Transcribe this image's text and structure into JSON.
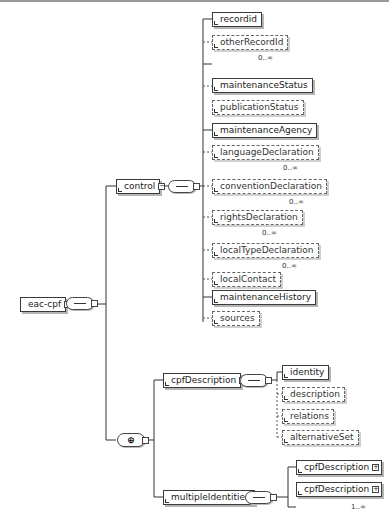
{
  "diagram": {
    "root": {
      "label": "eac-cpf",
      "toggle": "−"
    },
    "control": {
      "label": "control",
      "toggle": "−",
      "children": [
        {
          "label": "recordid",
          "optional": false,
          "cardinality": ""
        },
        {
          "label": "otherRecordId",
          "optional": true,
          "cardinality": "0..∞"
        },
        {
          "label": "maintenanceStatus",
          "optional": false,
          "cardinality": ""
        },
        {
          "label": "publicationStatus",
          "optional": true,
          "cardinality": ""
        },
        {
          "label": "maintenanceAgency",
          "optional": false,
          "cardinality": ""
        },
        {
          "label": "languageDeclaration",
          "optional": true,
          "cardinality": "0..∞"
        },
        {
          "label": "conventionDeclaration",
          "optional": true,
          "cardinality": "0..∞"
        },
        {
          "label": "rightsDeclaration",
          "optional": true,
          "cardinality": "0..∞"
        },
        {
          "label": "localTypeDeclaration",
          "optional": true,
          "cardinality": "0..∞"
        },
        {
          "label": "localContact",
          "optional": true,
          "cardinality": "0..∞"
        },
        {
          "label": "maintenanceHistory",
          "optional": false,
          "cardinality": ""
        },
        {
          "label": "sources",
          "optional": true,
          "cardinality": ""
        }
      ]
    },
    "choice": {
      "symbol": "⊕"
    },
    "cpfDescription": {
      "label": "cpfDescription",
      "toggle": "−",
      "children": [
        {
          "label": "identity",
          "optional": false
        },
        {
          "label": "description",
          "optional": true
        },
        {
          "label": "relations",
          "optional": true
        },
        {
          "label": "alternativeSet",
          "optional": true
        }
      ]
    },
    "multipleIdentities": {
      "label": "multipleIdentities",
      "toggle": "−",
      "children": [
        {
          "label": "cpfDescription",
          "toggle": "+",
          "cardinality": ""
        },
        {
          "label": "cpfDescription",
          "toggle": "+",
          "cardinality": "1..∞"
        }
      ]
    }
  }
}
